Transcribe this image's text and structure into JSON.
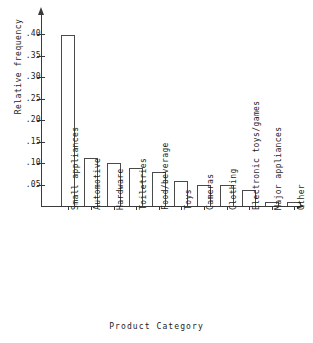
{
  "chart_data": {
    "type": "bar",
    "title": "",
    "subtitle": "",
    "xlabel": "Product Category",
    "ylabel": "Relative frequency",
    "categories": [
      "Small appliances",
      "Automotive",
      "Hardware",
      "Toiletries",
      "Food/beverage",
      "Toys",
      "Cameras",
      "Clothing",
      "Electronic toys/games",
      "Major appliances",
      "Other"
    ],
    "values": [
      0.398,
      0.112,
      0.1,
      0.088,
      0.079,
      0.058,
      0.049,
      0.048,
      0.038,
      0.009,
      0.009
    ],
    "ylim": [
      0,
      0.42
    ],
    "xlim": [
      0,
      11
    ],
    "ytick_values": [
      0.05,
      0.1,
      0.15,
      0.2,
      0.25,
      0.3,
      0.35,
      0.4
    ],
    "ytick_labels": [
      ".05",
      ".10",
      ".15",
      ".20",
      ".25",
      ".30",
      ".35",
      ".40"
    ],
    "grid": false,
    "legend": null,
    "legend_position": "none",
    "bar_fill_color": "#ffffff",
    "bar_edge_color": "#4a4a4a",
    "axis_color": "#3a3a3a",
    "background_color": "#ffffff",
    "text_color": "#1b1b1b",
    "axis_arrows": true,
    "annotations": []
  }
}
